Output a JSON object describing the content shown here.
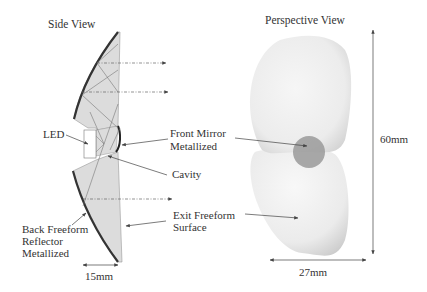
{
  "side_view": {
    "title": "Side View",
    "labels": {
      "led": "LED",
      "front_mirror_line1": "Front Mirror",
      "front_mirror_line2": "Metallized",
      "cavity": "Cavity",
      "exit_line1": "Exit Freeform",
      "exit_line2": "Surface",
      "back_line1": "Back Freeform",
      "back_line2": "Reflector",
      "back_line3": "Metallized"
    },
    "dimension": "15mm"
  },
  "perspective_view": {
    "title": "Perspective View",
    "height_dimension": "60mm",
    "width_dimension": "27mm"
  },
  "colors": {
    "body_fill": "#dcdcdc",
    "mirror": "#333333",
    "ray": "#666666",
    "spot": "#9a9a9a"
  }
}
